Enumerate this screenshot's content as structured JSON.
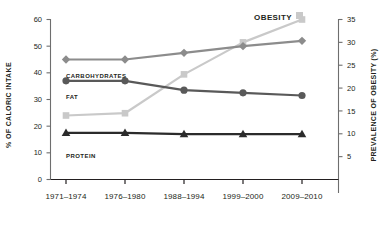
{
  "chart_data": {
    "type": "line",
    "title": "",
    "categories": [
      "1971–1974",
      "1976–1980",
      "1988–1994",
      "1999–2000",
      "2009–2010"
    ],
    "xlabel": "",
    "ylabel": "% OF CALORIC INTAKE",
    "ylabel_right": "PREVALENCE OF OBESITY (%)",
    "ylim": [
      0,
      60
    ],
    "ylim_right": [
      0,
      35
    ],
    "yticks": [
      0,
      10,
      20,
      30,
      40,
      50,
      60
    ],
    "yticks_right": [
      5,
      10,
      15,
      20,
      25,
      30,
      35
    ],
    "grid": false,
    "legend": "inline-labels",
    "series": [
      {
        "name": "CARBOHYDRATES",
        "axis": "left",
        "marker": "diamond",
        "color": "#8c8c8c",
        "values": [
          45,
          45,
          47.5,
          50,
          52
        ]
      },
      {
        "name": "FAT",
        "axis": "left",
        "marker": "circle",
        "color": "#595959",
        "values": [
          37,
          37,
          33.5,
          32.5,
          31.5
        ]
      },
      {
        "name": "PROTEIN",
        "axis": "left",
        "marker": "triangle",
        "color": "#2b2b2b",
        "values": [
          17.5,
          17.5,
          17,
          17,
          17
        ]
      },
      {
        "name": "OBESITY",
        "axis": "right",
        "marker": "square",
        "color": "#c9c9c9",
        "values": [
          14,
          14.5,
          23,
          30,
          35
        ]
      }
    ]
  },
  "labels": {
    "y_axis_left": "% OF CALORIC INTAKE",
    "y_axis_right": "PREVALENCE OF OBESITY (%)",
    "carbohydrates": "CARBOHYDRATES",
    "fat": "FAT",
    "protein": "PROTEIN",
    "obesity": "OBESITY"
  },
  "ticks": {
    "left": [
      "60",
      "50",
      "40",
      "30",
      "20",
      "10",
      "0"
    ],
    "right": [
      "35",
      "30",
      "25",
      "20",
      "15",
      "10",
      "5"
    ],
    "x": [
      "1971–1974",
      "1976–1980",
      "1988–1994",
      "1999–2000",
      "2009–2010"
    ]
  },
  "colors": {
    "carbohydrates": "#8c8c8c",
    "fat": "#595959",
    "protein": "#2b2b2b",
    "obesity": "#c9c9c9",
    "axis": "#6e6e6e",
    "text": "#231f20"
  }
}
